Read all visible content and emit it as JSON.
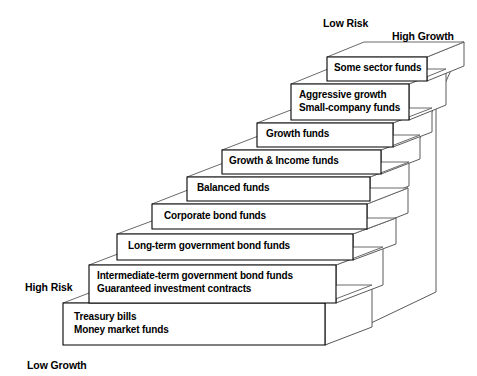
{
  "diagram": {
    "axis_labels": [
      {
        "name": "low-risk",
        "text": "Low Risk",
        "x": 323,
        "y": 17
      },
      {
        "name": "high-growth",
        "text": "High Growth",
        "x": 392,
        "y": 30
      },
      {
        "name": "high-risk",
        "text": "High Risk",
        "x": 25,
        "y": 281
      },
      {
        "name": "low-growth",
        "text": "Low Growth",
        "x": 27,
        "y": 359
      }
    ],
    "colors": {
      "background": "#ffffff",
      "outline": "#000000",
      "shade_outline": "#5a5a5a",
      "text": "#000000"
    },
    "steps": [
      {
        "id": "step-1",
        "lines": [
          "Treasury bills",
          "Money market funds"
        ],
        "front": {
          "x": 63,
          "y": 303,
          "w": 262,
          "h": 42
        },
        "label_x": 74,
        "label_y": 311,
        "top_offset_x": 47,
        "top_offset_y": -18
      },
      {
        "id": "step-2",
        "lines": [
          "Intermediate-term government bond funds",
          "Guaranteed investment contracts"
        ],
        "front": {
          "x": 89,
          "y": 265,
          "w": 247,
          "h": 38
        },
        "label_x": 97,
        "label_y": 270,
        "top_offset_x": 47,
        "top_offset_y": -18
      },
      {
        "id": "step-3",
        "lines": [
          "Long-term government bond funds"
        ],
        "front": {
          "x": 117,
          "y": 234,
          "w": 236,
          "h": 26
        },
        "label_x": 128,
        "label_y": 240,
        "top_offset_x": 43,
        "top_offset_y": -16
      },
      {
        "id": "step-4",
        "lines": [
          "Corporate bond funds"
        ],
        "front": {
          "x": 152,
          "y": 204,
          "w": 215,
          "h": 25
        },
        "label_x": 164,
        "label_y": 210,
        "top_offset_x": 41,
        "top_offset_y": -16
      },
      {
        "id": "step-5",
        "lines": [
          "Balanced funds"
        ],
        "front": {
          "x": 187,
          "y": 177,
          "w": 183,
          "h": 24
        },
        "label_x": 197,
        "label_y": 182,
        "top_offset_x": 39,
        "top_offset_y": -15
      },
      {
        "id": "step-6",
        "lines": [
          "Growth & Income funds"
        ],
        "front": {
          "x": 222,
          "y": 150,
          "w": 159,
          "h": 24
        },
        "label_x": 229,
        "label_y": 155,
        "top_offset_x": 39,
        "top_offset_y": -15
      },
      {
        "id": "step-7",
        "lines": [
          "Growth funds"
        ],
        "front": {
          "x": 257,
          "y": 123,
          "w": 136,
          "h": 24
        },
        "label_x": 266,
        "label_y": 128,
        "top_offset_x": 39,
        "top_offset_y": -15
      },
      {
        "id": "step-8",
        "lines": [
          "Aggressive growth",
          "Small-company funds"
        ],
        "front": {
          "x": 291,
          "y": 84,
          "w": 118,
          "h": 36
        },
        "label_x": 299,
        "label_y": 89,
        "top_offset_x": 37,
        "top_offset_y": -15
      },
      {
        "id": "step-9",
        "lines": [
          "Some sector funds"
        ],
        "front": {
          "x": 327,
          "y": 57,
          "w": 100,
          "h": 24
        },
        "label_x": 334,
        "label_y": 62,
        "top_offset_x": 37,
        "top_offset_y": -15
      }
    ],
    "body": {
      "right_top_x": 436,
      "right_top_y": 46,
      "right_bottom_y": 292,
      "base_front_right_x": 325,
      "base_front_bottom_y": 345
    }
  }
}
